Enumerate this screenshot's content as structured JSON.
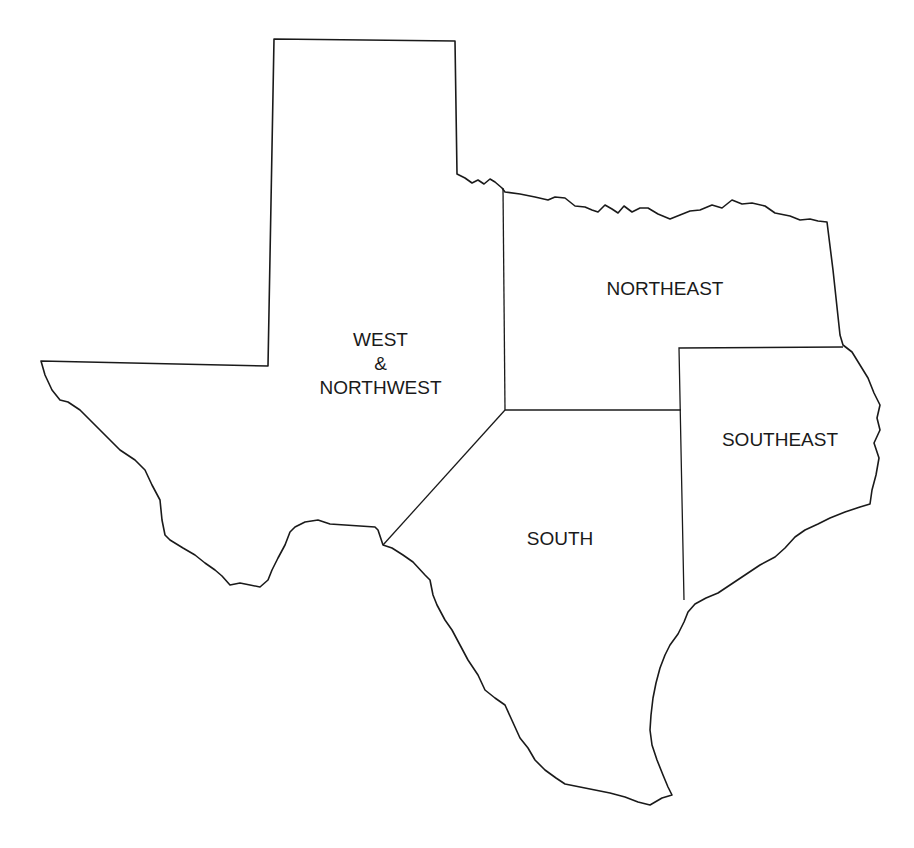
{
  "map": {
    "subject": "Texas regions",
    "regions": [
      {
        "id": "west-northwest",
        "label_lines": [
          "WEST",
          "&",
          "NORTHWEST"
        ]
      },
      {
        "id": "northeast",
        "label_lines": [
          "NORTHEAST"
        ]
      },
      {
        "id": "southeast",
        "label_lines": [
          "SOUTHEAST"
        ]
      },
      {
        "id": "south",
        "label_lines": [
          "SOUTH"
        ]
      }
    ],
    "colors": {
      "stroke": "#1a1a1a",
      "background": "#ffffff"
    }
  }
}
